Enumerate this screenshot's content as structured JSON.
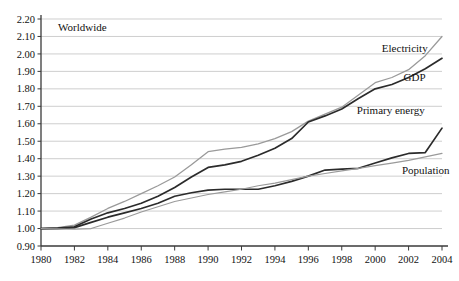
{
  "chart_data": {
    "type": "line",
    "title": "",
    "corner_label": "Worldwide",
    "xlabel": "",
    "ylabel": "",
    "xlim": [
      1980,
      2004
    ],
    "ylim": [
      0.9,
      2.2
    ],
    "grid": true,
    "legend_position": "inline-right",
    "x_tick_labels": [
      "1980",
      "1982",
      "1984",
      "1986",
      "1988",
      "1990",
      "1992",
      "1994",
      "1996",
      "1998",
      "2000",
      "2002",
      "2004"
    ],
    "y_tick_labels": [
      "0.90",
      "1.00",
      "1.10",
      "1.20",
      "1.30",
      "1.40",
      "1.50",
      "1.60",
      "1.70",
      "1.80",
      "1.90",
      "2.00",
      "2.10",
      "2.20"
    ],
    "x": [
      1980,
      1981,
      1982,
      1983,
      1984,
      1985,
      1986,
      1987,
      1988,
      1989,
      1990,
      1991,
      1992,
      1993,
      1994,
      1995,
      1996,
      1997,
      1998,
      1999,
      2000,
      2001,
      2002,
      2003,
      2004
    ],
    "series": [
      {
        "name": "Electricity",
        "color": "#9a9a9a",
        "width": 1.3,
        "label_x": 2000.4,
        "label_y": 2.01,
        "values": [
          1.0,
          1.005,
          1.02,
          1.065,
          1.115,
          1.155,
          1.2,
          1.245,
          1.295,
          1.365,
          1.44,
          1.455,
          1.465,
          1.485,
          1.515,
          1.555,
          1.615,
          1.655,
          1.695,
          1.765,
          1.835,
          1.865,
          1.91,
          1.99,
          2.1
        ]
      },
      {
        "name": "GDP",
        "color": "#2b2b2b",
        "width": 1.7,
        "label_x": 2001.7,
        "label_y": 1.845,
        "values": [
          1.0,
          1.002,
          1.01,
          1.055,
          1.09,
          1.115,
          1.145,
          1.185,
          1.235,
          1.295,
          1.35,
          1.365,
          1.385,
          1.42,
          1.46,
          1.515,
          1.61,
          1.645,
          1.685,
          1.745,
          1.8,
          1.825,
          1.865,
          1.915,
          1.975
        ]
      },
      {
        "name": "Primary energy",
        "color": "#2b2b2b",
        "width": 1.7,
        "label_x": 1998.9,
        "label_y": 1.655,
        "values": [
          1.0,
          1.0,
          1.005,
          1.035,
          1.065,
          1.09,
          1.115,
          1.145,
          1.185,
          1.205,
          1.22,
          1.225,
          1.225,
          1.225,
          1.245,
          1.27,
          1.3,
          1.335,
          1.34,
          1.345,
          1.375,
          1.405,
          1.43,
          1.435,
          1.575
        ]
      },
      {
        "name": "Population",
        "color": "#9a9a9a",
        "width": 1.2,
        "label_x": 2001.6,
        "label_y": 1.315,
        "values": [
          1.0,
          0.998,
          0.996,
          1.0,
          1.03,
          1.06,
          1.095,
          1.125,
          1.155,
          1.175,
          1.195,
          1.21,
          1.225,
          1.245,
          1.26,
          1.28,
          1.3,
          1.315,
          1.33,
          1.345,
          1.36,
          1.375,
          1.39,
          1.41,
          1.43
        ]
      }
    ]
  }
}
